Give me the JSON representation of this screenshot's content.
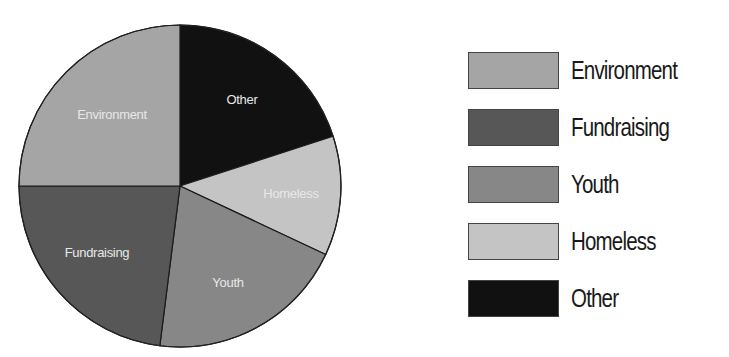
{
  "chart_data": {
    "type": "pie",
    "title": "",
    "start_angle_deg": 0,
    "direction": "clockwise",
    "categories": [
      "Other",
      "Homeless",
      "Youth",
      "Fundraising",
      "Environment"
    ],
    "values": [
      20,
      12,
      20,
      23,
      25
    ],
    "colors": [
      "#111111",
      "#c4c4c4",
      "#878787",
      "#575757",
      "#a5a5a5"
    ],
    "slice_labels": [
      "Other",
      "Homeless",
      "Youth",
      "Fundraising",
      "Environment"
    ],
    "legend": {
      "position": "right",
      "entries": [
        "Environment",
        "Fundraising",
        "Youth",
        "Homeless",
        "Other"
      ]
    }
  },
  "legend": {
    "items": [
      {
        "label": "Environment",
        "color": "#a5a5a5"
      },
      {
        "label": "Fundraising",
        "color": "#575757"
      },
      {
        "label": "Youth",
        "color": "#878787"
      },
      {
        "label": "Homeless",
        "color": "#c4c4c4"
      },
      {
        "label": "Other",
        "color": "#111111"
      }
    ]
  },
  "labels": {
    "other": "Other",
    "homeless": "Homeless",
    "youth": "Youth",
    "fundraising": "Fundraising",
    "environment": "Environment"
  }
}
